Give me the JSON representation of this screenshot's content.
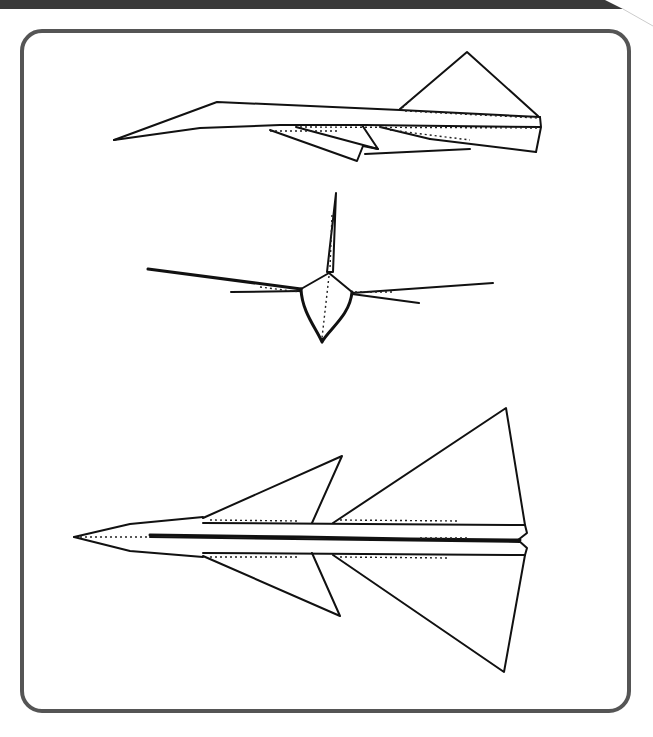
{
  "page": {
    "background_color": "#ffffff"
  },
  "banner": {
    "color": "#3a3a3a"
  },
  "frame": {
    "border_color": "#555555",
    "corner_radius_px": 22
  },
  "figures": [
    {
      "id": "side-view",
      "label": "Side view of paper airplane"
    },
    {
      "id": "front-view",
      "label": "Front view of paper airplane"
    },
    {
      "id": "top-view",
      "label": "Top view of paper airplane"
    }
  ],
  "ink_color": "#111111"
}
